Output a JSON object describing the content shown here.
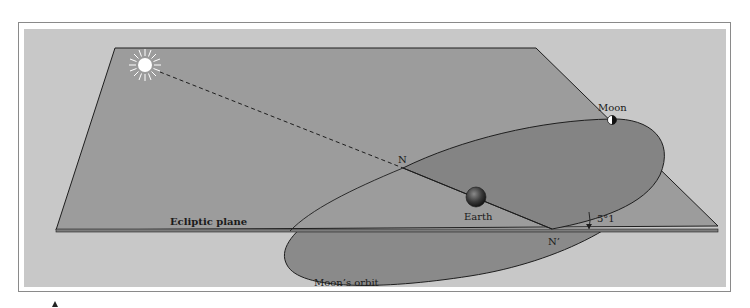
{
  "figure": {
    "labels": {
      "moon": "Moon",
      "node_ascending": "N",
      "earth": "Earth",
      "node_descending": "N’",
      "angle": "5°1",
      "ecliptic_plane": "Ecliptic plane",
      "moons_orbit": "Moon’s orbit"
    },
    "bodies": [
      {
        "name": "sun",
        "icon": "sun-icon"
      },
      {
        "name": "earth",
        "icon": "earth-icon"
      },
      {
        "name": "moon",
        "icon": "moon-icon"
      }
    ],
    "colors": {
      "background_panel": "#c8c8c8",
      "ecliptic_plane_fill": "#9a9a9a",
      "orbit_fill": "#878787",
      "line": "#1e1e1e"
    }
  }
}
